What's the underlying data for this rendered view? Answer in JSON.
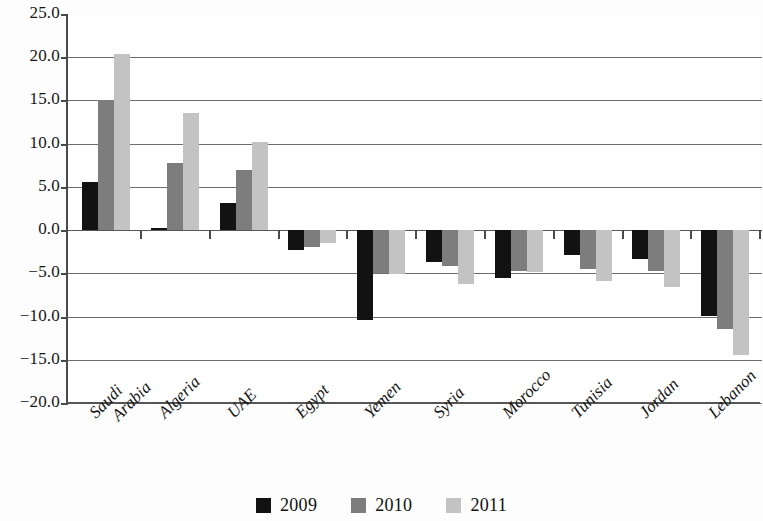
{
  "chart_data": {
    "type": "bar",
    "title": "",
    "subtitle": "",
    "xlabel": "",
    "ylabel": "",
    "ylim": [
      -20.0,
      25.0
    ],
    "ytick_step": 5.0,
    "grid": true,
    "legend_position": "bottom",
    "categories": [
      "Saudi Arabia",
      "Algeria",
      "UAE",
      "Egypt",
      "Yemen",
      "Syria",
      "Morocco",
      "Tunisia",
      "Jordan",
      "Lebanon"
    ],
    "category_lines": [
      [
        "Saudi",
        "Arabia"
      ],
      [
        "Algeria"
      ],
      [
        "UAE"
      ],
      [
        "Egypt"
      ],
      [
        "Yemen"
      ],
      [
        "Syria"
      ],
      [
        "Morocco"
      ],
      [
        "Tunisia"
      ],
      [
        "Jordan"
      ],
      [
        "Lebanon"
      ]
    ],
    "tick_labels": [
      "25.0",
      "20.0",
      "15.0",
      "10.0",
      "5.0",
      "0.0",
      "-5.0",
      "-10.0",
      "-15.0",
      "-20.0"
    ],
    "tick_values": [
      25.0,
      20.0,
      15.0,
      10.0,
      5.0,
      0.0,
      -5.0,
      -10.0,
      -15.0,
      -20.0
    ],
    "series": [
      {
        "name": "2009",
        "color": "#121212",
        "values": [
          5.6,
          0.2,
          3.1,
          -2.3,
          -10.4,
          -3.7,
          -5.5,
          -2.9,
          -3.3,
          -9.9
        ]
      },
      {
        "name": "2010",
        "color": "#7d7d7d",
        "values": [
          15.0,
          7.8,
          7.0,
          -1.9,
          -5.0,
          -4.1,
          -4.7,
          -4.5,
          -4.7,
          -11.4
        ]
      },
      {
        "name": "2011",
        "color": "#c3c3c3",
        "values": [
          20.4,
          13.5,
          10.2,
          -1.5,
          -5.1,
          -6.2,
          -4.9,
          -5.9,
          -6.6,
          -14.5
        ]
      }
    ]
  },
  "legend": {
    "items": [
      {
        "label": "2009",
        "color": "#121212"
      },
      {
        "label": "2010",
        "color": "#7d7d7d"
      },
      {
        "label": "2011",
        "color": "#c3c3c3"
      }
    ]
  }
}
